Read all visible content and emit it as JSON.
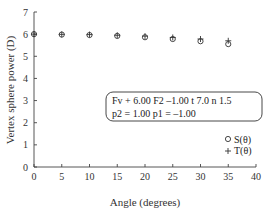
{
  "chart_data": {
    "type": "scatter",
    "title": "",
    "xlabel": "Angle (degrees)",
    "ylabel": "Vertex sphere power (D)",
    "xlim": [
      0,
      40
    ],
    "ylim": [
      0,
      7
    ],
    "xticks": [
      0,
      5,
      10,
      15,
      20,
      25,
      30,
      35,
      40
    ],
    "yticks": [
      0,
      1,
      2,
      3,
      4,
      5,
      6,
      7
    ],
    "grid": false,
    "legend_position": "lower right",
    "x": [
      0,
      5,
      10,
      15,
      20,
      25,
      30,
      35
    ],
    "series": [
      {
        "name": "S(θ)",
        "marker": "circle",
        "values": [
          6.0,
          5.98,
          5.96,
          5.92,
          5.86,
          5.78,
          5.68,
          5.55
        ]
      },
      {
        "name": "T(θ)",
        "marker": "plus",
        "values": [
          6.0,
          5.99,
          5.98,
          5.95,
          5.91,
          5.85,
          5.78,
          5.7
        ]
      }
    ],
    "annotation": {
      "line1": "Fv + 6.00   F2 –1.00   t 7.0   n 1.5",
      "line2": "p2 = 1.00   p1 = –1.00"
    }
  },
  "legend": {
    "s_label": "S(θ)",
    "t_label": "T(θ)"
  }
}
